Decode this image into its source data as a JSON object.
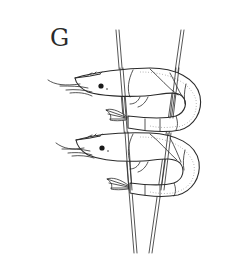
{
  "figure": {
    "panel_label": "G",
    "subjects": [
      {
        "name": "upper-shrimp",
        "position": "top"
      },
      {
        "name": "lower-shrimp",
        "position": "bottom"
      }
    ],
    "skewer_count": 2,
    "colors": {
      "ink": "#2b2b2b",
      "background": "#ffffff"
    }
  }
}
